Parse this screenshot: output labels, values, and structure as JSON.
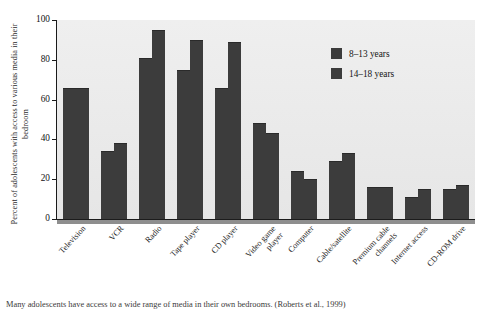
{
  "figure": {
    "caption": "Many adolescents have access to a wide range of media in their own bedrooms. (Roberts et al., 1999)"
  },
  "chart_data": {
    "type": "bar",
    "title": "",
    "xlabel": "",
    "ylabel": "Percent of adolescents with access to various media in their bedroom",
    "ylim": [
      0,
      100
    ],
    "yticks": [
      0,
      20,
      40,
      60,
      80,
      100
    ],
    "ytick_labels": [
      "0",
      "20",
      "40",
      "60",
      "80",
      "100"
    ],
    "grid": false,
    "legend_position": "top-right",
    "categories": [
      "Television",
      "VCR",
      "Radio",
      "Tape player",
      "CD player",
      "Video game player",
      "Computer",
      "Cable/satellite",
      "Premium cable channels",
      "Internet access",
      "CD-ROM drive"
    ],
    "series": [
      {
        "name": "8–13 years",
        "color": "#3c3c3c",
        "values": [
          66,
          34,
          81,
          75,
          66,
          48,
          24,
          29,
          16,
          11,
          15
        ]
      },
      {
        "name": "14–18 years",
        "color": "#3c3c3c",
        "values": [
          66,
          38,
          95,
          90,
          89,
          43,
          20,
          33,
          16,
          15,
          17
        ]
      }
    ]
  },
  "colors": {
    "bar": "#3c3c3c",
    "plot_background": "#ececec",
    "axis": "#1a1a1a",
    "baseline": "#8e8e8e",
    "page_background": "#ffffff"
  }
}
